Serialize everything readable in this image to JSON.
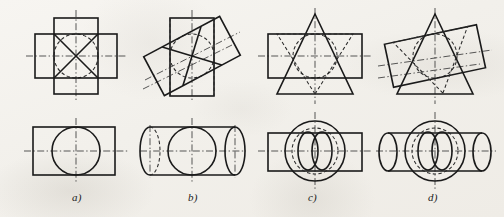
{
  "figure": {
    "background_color": "#f3f1ec",
    "line_color": "#1a1a1a",
    "panels": [
      {
        "id": "a",
        "caption": "a)",
        "caption_x": 72,
        "caption_y": 191,
        "front_view": {
          "description": "Cross (plus) shaped outline formed by a vertical and a horizontal rectangle, dashed circle inscribed in central square, solid diagonals forming an X, vertical and horizontal dash-dot centrelines",
          "shape": "cross",
          "tilt_degrees": 0
        },
        "top_view": {
          "description": "Rectangle with inscribed solid circle and crossing dash-dot centrelines",
          "shape": "rectangle-with-circle"
        }
      },
      {
        "id": "b",
        "caption": "b)",
        "caption_x": 188,
        "caption_y": 191,
        "front_view": {
          "description": "Vertical rectangle crossed by a rectangle rotated about 35 degrees, dashed circle arcs, inclined dash-dot centreline",
          "shape": "cross",
          "tilt_degrees": 35
        },
        "top_view": {
          "description": "Cylinder drawn with an ellipse at each end and a circle at the centre, dashed hidden ellipse, dash-dot centrelines",
          "shape": "cylinder-with-circle"
        }
      },
      {
        "id": "c",
        "caption": "c)",
        "caption_x": 308,
        "caption_y": 191,
        "front_view": {
          "description": "Upright triangle crossed by a horizontal rectangle with a dashed inscribed circle and a dashed inverted triangle, vertical and horizontal dash-dot centrelines",
          "shape": "triangle",
          "tilt_degrees": 0
        },
        "top_view": {
          "description": "Rectangle with a large solid circle, dashed inner circle and two overlapping vertical ellipses forming a vesica at the centre",
          "shape": "rectangle-with-circles"
        }
      },
      {
        "id": "d",
        "caption": "d)",
        "caption_x": 428,
        "caption_y": 191,
        "front_view": {
          "description": "Upright triangle crossed by a rectangle rotated about 15 degrees, dashed circle and dashed inverted triangle, inclined dash-dot centreline",
          "shape": "triangle",
          "tilt_degrees": 15
        },
        "top_view": {
          "description": "Cylinder with end ellipses crossed by a large solid circle, dashed inner circle and two overlapping vertical ellipses at the centre",
          "shape": "cylinder-with-circles"
        }
      }
    ]
  }
}
